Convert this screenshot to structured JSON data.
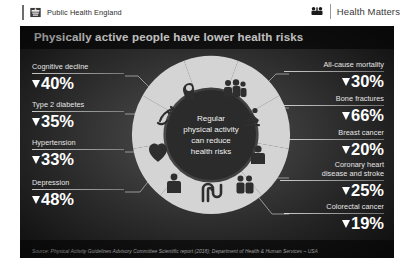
{
  "header": {
    "phe_label": "Public Health England",
    "phe_crest_icon": "royal-crest-icon",
    "brand_label": "Health Matters",
    "brand_icon": "health-matters-icon"
  },
  "poster": {
    "title": "Physically active people have lower health risks",
    "source": "Source: Physical Activity Guidelines Advisory Committee Scientific report (2018); Department of Health & Human Services – USA",
    "center": {
      "line1": "Regular",
      "line2": "physical activity",
      "line3": "can reduce",
      "line4": "health risks"
    },
    "left_stats": [
      {
        "label": "Cognitive decline",
        "value": "40%",
        "direction": "down",
        "icon": "brain-icon"
      },
      {
        "label": "Type 2 diabetes",
        "value": "35%",
        "direction": "down",
        "icon": "blood-drop-icon"
      },
      {
        "label": "Hypertension",
        "value": "33%",
        "direction": "down",
        "icon": "heart-icon"
      },
      {
        "label": "Depression",
        "value": "48%",
        "direction": "down",
        "icon": "sad-person-icon"
      }
    ],
    "right_stats": [
      {
        "label": "All-cause mortality",
        "value": "30%",
        "direction": "down",
        "icon": "family-group-icon"
      },
      {
        "label": "Bone fractures",
        "value": "66%",
        "direction": "down",
        "icon": "falling-person-icon"
      },
      {
        "label": "Breast cancer",
        "value": "20%",
        "direction": "down",
        "icon": "woman-icon"
      },
      {
        "label": "Coronary heart disease and stroke",
        "label_line1": "Coronary heart",
        "label_line2": "disease and stroke",
        "value": "25%",
        "direction": "down",
        "icon": "two-people-icon"
      },
      {
        "label": "Colorectal cancer",
        "value": "19%",
        "direction": "down",
        "icon": "intestine-icon"
      }
    ],
    "wheel_icons": [
      "brain-icon",
      "family-group-icon",
      "falling-person-icon",
      "woman-icon",
      "two-people-icon",
      "intestine-icon",
      "sad-person-icon",
      "heart-icon",
      "blood-drop-icon"
    ]
  },
  "colors": {
    "poster_bg": "#2c2c2c",
    "title_band": "#111111",
    "text": "#ffffff",
    "segment_light": "#d9d9d9",
    "segment_icon": "#2f2f2f"
  }
}
